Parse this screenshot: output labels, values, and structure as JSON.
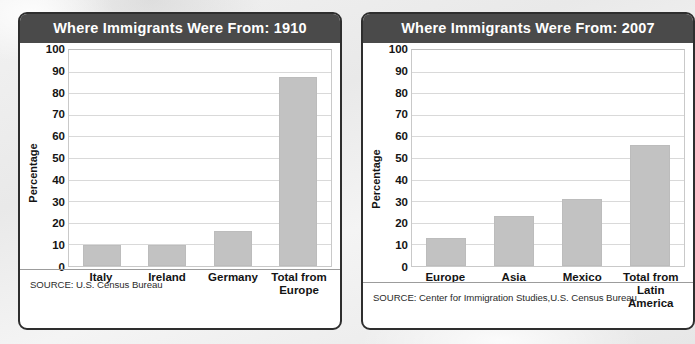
{
  "background": {
    "accent_dark": "#4a4a4a",
    "bar_color": "#c2c2c2",
    "border_color": "#2e2e2e"
  },
  "panels": [
    {
      "title": "Where Immigrants Were From: 1910",
      "source": "SOURCE: U.S. Census Bureau",
      "ylabel": "Percentage",
      "ticks": [
        "100",
        "90",
        "80",
        "70",
        "60",
        "50",
        "40",
        "30",
        "20",
        "10",
        "0"
      ]
    },
    {
      "title": "Where Immigrants Were From: 2007",
      "source": "SOURCE: Center for Immigration Studies,U.S. Census Bureau",
      "ylabel": "Percentage",
      "ticks": [
        "100",
        "90",
        "80",
        "70",
        "60",
        "50",
        "40",
        "30",
        "20",
        "10",
        "0"
      ]
    }
  ],
  "chart_data": [
    {
      "type": "bar",
      "title": "Where Immigrants Were From: 1910",
      "categories": [
        "Italy",
        "Ireland",
        "Germany",
        "Total from\nEurope"
      ],
      "values": [
        9.7,
        9.7,
        16.3,
        87.5
      ],
      "xlabel": "",
      "ylabel": "Percentage",
      "ylim": [
        0,
        100
      ],
      "ytick_step": 10,
      "grid": true,
      "legend": "none",
      "source": "SOURCE: U.S. Census Bureau"
    },
    {
      "type": "bar",
      "title": "Where Immigrants Were From: 2007",
      "categories": [
        "Europe",
        "Asia",
        "Mexico",
        "Total from\nLatin\nAmerica"
      ],
      "values": [
        12.8,
        23.0,
        31.2,
        55.8
      ],
      "xlabel": "",
      "ylabel": "Percentage",
      "ylim": [
        0,
        100
      ],
      "ytick_step": 10,
      "grid": true,
      "legend": "none",
      "source": "SOURCE: Center for Immigration Studies,U.S. Census Bureau"
    }
  ]
}
